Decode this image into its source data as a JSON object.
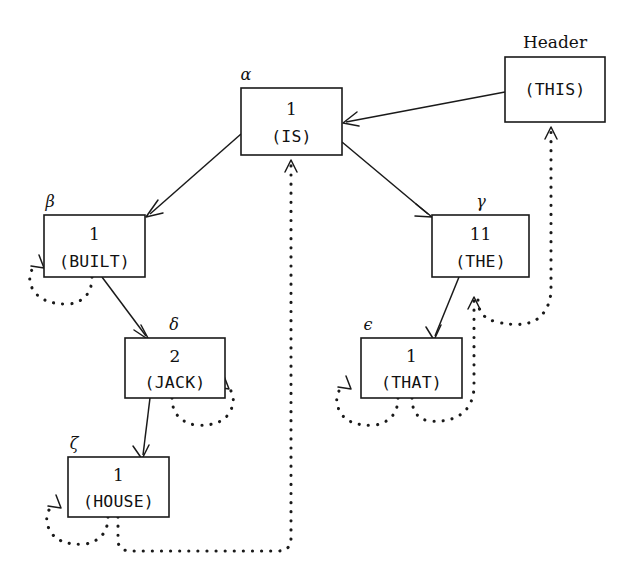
{
  "diagram": {
    "title_label": "Header",
    "background": "#ffffff",
    "ink": "#1a1a1a",
    "nodes": [
      {
        "id": "alpha",
        "tag": "α",
        "count": "1",
        "word": "(IS)",
        "x": 241,
        "y": 88,
        "w": 101,
        "h": 67
      },
      {
        "id": "beta",
        "tag": "β",
        "count": "1",
        "word": "(BUILT)",
        "x": 44,
        "y": 215,
        "w": 101,
        "h": 62
      },
      {
        "id": "gamma",
        "tag": "γ",
        "count": "11",
        "word": "(THE)",
        "x": 432,
        "y": 215,
        "w": 97,
        "h": 62
      },
      {
        "id": "delta",
        "tag": "δ",
        "count": "2",
        "word": "(JACK)",
        "x": 125,
        "y": 338,
        "w": 100,
        "h": 60
      },
      {
        "id": "epsilon",
        "tag": "ϵ",
        "count": "1",
        "word": "(THAT)",
        "x": 361,
        "y": 338,
        "w": 101,
        "h": 60
      },
      {
        "id": "zeta",
        "tag": "ζ",
        "count": "1",
        "word": "(HOUSE)",
        "x": 68,
        "y": 457,
        "w": 101,
        "h": 60
      },
      {
        "id": "this",
        "tag": "",
        "count": "",
        "word": "(THIS)",
        "x": 505,
        "y": 57,
        "w": 100,
        "h": 65
      }
    ],
    "edges": [
      {
        "id": "this-to-alpha",
        "from": "this",
        "to": "alpha",
        "style": "solid"
      },
      {
        "id": "alpha-to-beta",
        "from": "alpha",
        "to": "beta",
        "style": "solid"
      },
      {
        "id": "alpha-to-gamma",
        "from": "alpha",
        "to": "gamma",
        "style": "solid"
      },
      {
        "id": "beta-to-delta",
        "from": "beta",
        "to": "delta",
        "style": "solid"
      },
      {
        "id": "delta-to-zeta",
        "from": "delta",
        "to": "zeta",
        "style": "solid"
      },
      {
        "id": "gamma-to-epsilon",
        "from": "gamma",
        "to": "epsilon",
        "style": "solid"
      },
      {
        "id": "beta-self-loop",
        "from": "beta",
        "to": "beta",
        "style": "dotted"
      },
      {
        "id": "delta-self-loop",
        "from": "delta",
        "to": "delta",
        "style": "dotted"
      },
      {
        "id": "epsilon-self-loop",
        "from": "epsilon",
        "to": "epsilon",
        "style": "dotted"
      },
      {
        "id": "zeta-self-loop",
        "from": "zeta",
        "to": "zeta",
        "style": "dotted"
      },
      {
        "id": "zeta-to-alpha",
        "from": "zeta",
        "to": "alpha",
        "style": "dotted"
      },
      {
        "id": "epsilon-to-gamma",
        "from": "epsilon",
        "to": "gamma",
        "style": "dotted"
      },
      {
        "id": "gamma-to-this",
        "from": "gamma",
        "to": "this",
        "style": "dotted"
      }
    ]
  }
}
